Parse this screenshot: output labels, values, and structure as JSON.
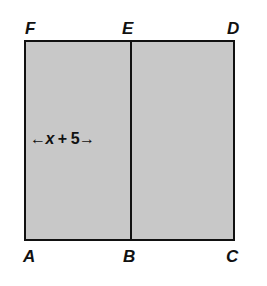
{
  "diagram": {
    "type": "geometry-rectangle",
    "vertices": {
      "F": "F",
      "E": "E",
      "D": "D",
      "A": "A",
      "B": "B",
      "C": "C"
    },
    "dimension": {
      "left_arrow": "←",
      "variable": "x",
      "operator": " + ",
      "constant": "5",
      "right_arrow": "→"
    },
    "colors": {
      "fill": "#c8c8c8",
      "stroke": "#111111"
    }
  }
}
